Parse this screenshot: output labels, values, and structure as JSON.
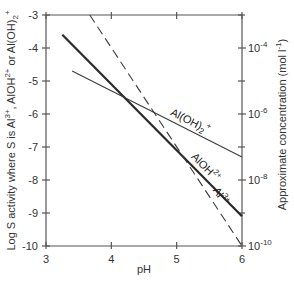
{
  "chart_data": {
    "type": "line",
    "title": "",
    "xlabel": "pH",
    "ylabel": "Log S activity where S is Al3+, AlOH2+ or Al(OH)2+",
    "ylabel_parts": {
      "prefix": "Log S activity where S is Al",
      "sup1": "3+",
      "mid1": ", AlOH",
      "sup2": "2+",
      "mid2": " or Al(OH)",
      "sub3": "2",
      "sup3": "+"
    },
    "y2label": "Approximate concentration (mol l-1)",
    "y2label_parts": {
      "prefix": "Approximate concentration (mol l",
      "sup": "-1",
      "suffix": ")"
    },
    "xlim": [
      3,
      6
    ],
    "ylim": [
      -10,
      -3
    ],
    "xticks": [
      3,
      4,
      5,
      6
    ],
    "xtick_labels": [
      "3",
      "4",
      "5",
      "6"
    ],
    "yticks": [
      -3,
      -4,
      -5,
      -6,
      -7,
      -8,
      -9,
      -10
    ],
    "ytick_labels": [
      "-3",
      "-4",
      "-5",
      "-6",
      "-7",
      "-8",
      "-9",
      "-10"
    ],
    "y2ticks_major": [
      -4,
      -6,
      -8,
      -10
    ],
    "y2tick_labels": [
      {
        "base": "10",
        "exp": "-4"
      },
      {
        "base": "10",
        "exp": "-6"
      },
      {
        "base": "10",
        "exp": "-8"
      },
      {
        "base": "10",
        "exp": "-10"
      }
    ],
    "y2ticks_minor": [
      -3,
      -5,
      -7,
      -9
    ],
    "grid": false,
    "series": [
      {
        "name": "AlOH2+",
        "label_base": "AlOH",
        "label_sup": "2+",
        "style": "solid-thick",
        "color": "#2a2a2a",
        "x": [
          3.25,
          6
        ],
        "y": [
          -3.6,
          -9.1
        ]
      },
      {
        "name": "Al(OH)2+",
        "label_base": "Al(OH)",
        "label_sub": "2",
        "label_sup": "+",
        "style": "solid-thin",
        "color": "#3a3a3a",
        "x": [
          3.4,
          6
        ],
        "y": [
          -4.7,
          -7.3
        ]
      },
      {
        "name": "Al3+",
        "label_base": "Al",
        "label_sup": "3+",
        "style": "dashed",
        "color": "#3a3a3a",
        "x": [
          3.67,
          6
        ],
        "y": [
          -3,
          -10
        ]
      }
    ]
  }
}
